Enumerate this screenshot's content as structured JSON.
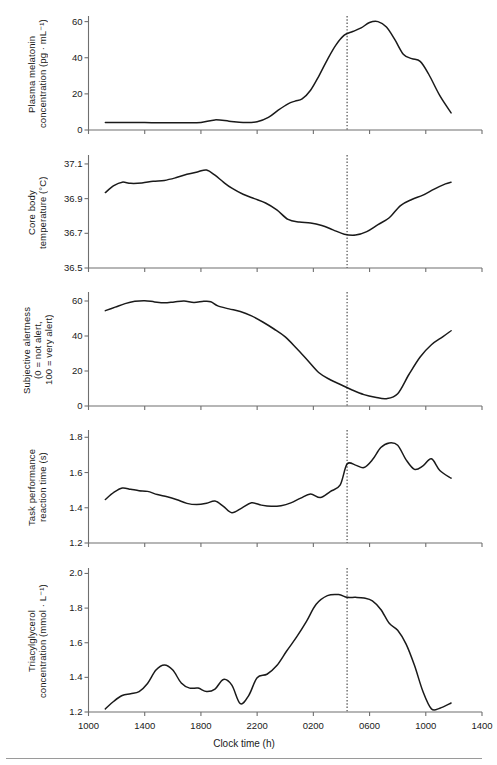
{
  "figure": {
    "xaxis_title": "Clock time (h)",
    "xtick_labels": [
      "1000",
      "1400",
      "1800",
      "2200",
      "0200",
      "0600",
      "1000",
      "1400"
    ],
    "xtick_values": [
      600,
      1000,
      1400,
      1800,
      2200,
      2600,
      3000,
      3400
    ],
    "reference_line_label": "0440",
    "reference_line_value": 2440
  },
  "chart_data": [
    {
      "type": "line",
      "panel_index": 0,
      "title": "",
      "xlabel": "Clock time (h)",
      "ylabel": "Plasma melatonin concentration (pg · mL⁻¹)",
      "ylabel_lines": [
        "Plasma melatonin",
        "concentration (pg · mL⁻¹)"
      ],
      "ytick_labels": [
        "0",
        "20",
        "40",
        "60"
      ],
      "yticks": [
        0,
        20,
        40,
        60
      ],
      "ylim": [
        0,
        62
      ],
      "xlim": [
        600,
        3400
      ],
      "grid": false,
      "legend": "none",
      "reference_line_x": 2440,
      "x": [
        720,
        800,
        900,
        1000,
        1100,
        1200,
        1300,
        1400,
        1500,
        1600,
        1700,
        1800,
        1880,
        1950,
        2020,
        2070,
        2120,
        2180,
        2240,
        2300,
        2360,
        2420,
        2480,
        2540,
        2600,
        2660,
        2720,
        2780,
        2840,
        2900,
        2960,
        3020,
        3100,
        3180
      ],
      "y": [
        4.2,
        4.2,
        4.1,
        4.1,
        4.0,
        4.0,
        4.0,
        4.2,
        5.6,
        4.9,
        4.1,
        4.6,
        7.0,
        11.0,
        14.5,
        16.0,
        17.2,
        22.0,
        30.0,
        39.0,
        47.0,
        52.5,
        54.5,
        56.5,
        59.5,
        60.0,
        57.0,
        50.0,
        42.0,
        39.5,
        38.0,
        31.0,
        19.0,
        9.5
      ]
    },
    {
      "type": "line",
      "panel_index": 1,
      "title": "",
      "xlabel": "Clock time (h)",
      "ylabel": "Core body temperature (°C)",
      "ylabel_lines": [
        "Core body",
        "temperature (°C)"
      ],
      "ytick_labels": [
        "36.5",
        "36.7",
        "36.9",
        "37.1"
      ],
      "yticks": [
        36.5,
        36.7,
        36.9,
        37.1
      ],
      "ylim": [
        36.5,
        37.14
      ],
      "xlim": [
        600,
        3400
      ],
      "grid": false,
      "legend": "none",
      "reference_line_x": 2440,
      "x": [
        720,
        780,
        840,
        900,
        980,
        1060,
        1140,
        1220,
        1300,
        1380,
        1440,
        1500,
        1560,
        1620,
        1700,
        1780,
        1860,
        1940,
        2020,
        2100,
        2180,
        2260,
        2340,
        2420,
        2500,
        2580,
        2660,
        2740,
        2820,
        2900,
        2980,
        3060,
        3140,
        3180
      ],
      "y": [
        36.935,
        36.975,
        36.995,
        36.988,
        36.99,
        37.0,
        37.005,
        37.02,
        37.04,
        37.055,
        37.065,
        37.035,
        36.995,
        36.96,
        36.925,
        36.9,
        36.875,
        36.835,
        36.78,
        36.765,
        36.76,
        36.745,
        36.72,
        36.695,
        36.69,
        36.71,
        36.75,
        36.79,
        36.86,
        36.895,
        36.92,
        36.955,
        36.985,
        36.995
      ]
    },
    {
      "type": "line",
      "panel_index": 2,
      "title": "",
      "xlabel": "Clock time (h)",
      "ylabel": "Subjective alertness (0 = not alert, 100 = very alert)",
      "ylabel_lines": [
        "Subjective alertness",
        "(0 = not alert,",
        "100 = very alert)"
      ],
      "ytick_labels": [
        "0",
        "20",
        "40",
        "60"
      ],
      "yticks": [
        0,
        20,
        40,
        60
      ],
      "ylim": [
        0,
        64
      ],
      "xlim": [
        600,
        3400
      ],
      "grid": false,
      "legend": "none",
      "reference_line_x": 2440,
      "x": [
        720,
        790,
        860,
        930,
        1000,
        1070,
        1140,
        1210,
        1280,
        1350,
        1420,
        1470,
        1520,
        1600,
        1680,
        1760,
        1840,
        1920,
        2000,
        2080,
        2160,
        2240,
        2320,
        2400,
        2480,
        2560,
        2640,
        2720,
        2800,
        2880,
        2960,
        3040,
        3120,
        3180
      ],
      "y": [
        54.5,
        56.5,
        58.5,
        59.8,
        60.2,
        59.5,
        59.0,
        59.5,
        60.0,
        59.2,
        59.8,
        59.6,
        57.2,
        55.5,
        54.0,
        51.5,
        48.0,
        44.0,
        39.5,
        33.0,
        26.0,
        19.0,
        15.0,
        12.0,
        9.0,
        6.5,
        5.0,
        4.2,
        7.0,
        18.0,
        28.0,
        35.0,
        39.5,
        43.0
      ]
    },
    {
      "type": "line",
      "panel_index": 3,
      "title": "",
      "xlabel": "Clock time (h)",
      "ylabel": "Task performance reaction time (s)",
      "ylabel_lines": [
        "Task performance",
        "reaction time (s)"
      ],
      "ytick_labels": [
        "1.2",
        "1.4",
        "1.6",
        "1.8"
      ],
      "yticks": [
        1.2,
        1.4,
        1.6,
        1.8
      ],
      "ylim": [
        1.2,
        1.83
      ],
      "xlim": [
        600,
        3400
      ],
      "grid": false,
      "legend": "none",
      "reference_line_x": 2440,
      "x": [
        720,
        780,
        840,
        900,
        960,
        1020,
        1090,
        1160,
        1230,
        1300,
        1370,
        1440,
        1500,
        1560,
        1620,
        1690,
        1760,
        1830,
        1900,
        1970,
        2040,
        2110,
        2180,
        2250,
        2320,
        2390,
        2440,
        2500,
        2560,
        2620,
        2680,
        2740,
        2800,
        2860,
        2920,
        2980,
        3040,
        3100,
        3180
      ],
      "y": [
        1.447,
        1.487,
        1.512,
        1.505,
        1.497,
        1.493,
        1.475,
        1.462,
        1.445,
        1.425,
        1.418,
        1.425,
        1.438,
        1.408,
        1.372,
        1.398,
        1.428,
        1.415,
        1.408,
        1.412,
        1.428,
        1.455,
        1.478,
        1.458,
        1.492,
        1.528,
        1.648,
        1.642,
        1.628,
        1.672,
        1.742,
        1.768,
        1.755,
        1.672,
        1.618,
        1.638,
        1.678,
        1.612,
        1.568
      ]
    },
    {
      "type": "line",
      "panel_index": 4,
      "title": "",
      "xlabel": "Clock time (h)",
      "ylabel": "Triacylglycerol concentration (mmol · L⁻¹)",
      "ylabel_lines": [
        "Triacylglycerol",
        "concentration (mmol · L⁻¹)"
      ],
      "ytick_labels": [
        "1.2",
        "1.4",
        "1.6",
        "1.8",
        "2.0"
      ],
      "yticks": [
        1.2,
        1.4,
        1.6,
        1.8,
        2.0
      ],
      "ylim": [
        1.2,
        2.02
      ],
      "xlim": [
        600,
        3400
      ],
      "grid": false,
      "legend": "none",
      "reference_line_x": 2440,
      "x": [
        720,
        780,
        840,
        900,
        960,
        1020,
        1080,
        1140,
        1200,
        1260,
        1320,
        1380,
        1440,
        1500,
        1560,
        1620,
        1680,
        1740,
        1800,
        1870,
        1940,
        2010,
        2080,
        2150,
        2220,
        2300,
        2380,
        2440,
        2500,
        2560,
        2620,
        2680,
        2740,
        2800,
        2860,
        2920,
        2980,
        3040,
        3100,
        3180
      ],
      "y": [
        1.218,
        1.262,
        1.295,
        1.305,
        1.318,
        1.365,
        1.442,
        1.472,
        1.442,
        1.368,
        1.338,
        1.338,
        1.318,
        1.332,
        1.388,
        1.355,
        1.248,
        1.295,
        1.398,
        1.418,
        1.468,
        1.552,
        1.632,
        1.722,
        1.822,
        1.872,
        1.878,
        1.862,
        1.862,
        1.858,
        1.842,
        1.792,
        1.712,
        1.672,
        1.592,
        1.468,
        1.318,
        1.218,
        1.222,
        1.252
      ]
    }
  ]
}
